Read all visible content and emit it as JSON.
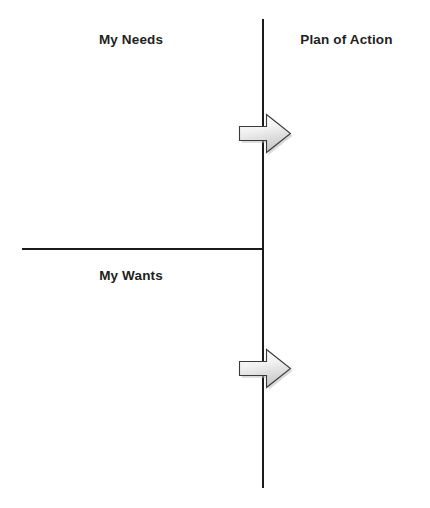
{
  "diagram": {
    "background_color": "#ffffff",
    "line_color": "#1b1b1b",
    "text_color": "#221f20",
    "quadrant_labels": {
      "top_left": "My Needs",
      "bottom_left": "My Wants",
      "right": "Plan of Action"
    },
    "arrows": [
      {
        "name": "needs-to-plan-arrow",
        "direction": "right",
        "fill_start": "#ffffff",
        "fill_end": "#cfcfcf",
        "stroke": "#3a3a3a"
      },
      {
        "name": "wants-to-plan-arrow",
        "direction": "right",
        "fill_start": "#ffffff",
        "fill_end": "#cfcfcf",
        "stroke": "#3a3a3a"
      }
    ],
    "dividers": {
      "vertical": "vertical-divider",
      "horizontal": "horizontal-divider"
    }
  }
}
